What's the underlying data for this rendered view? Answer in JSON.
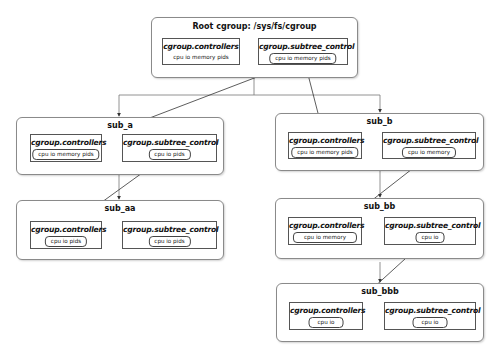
{
  "root": {
    "title": "Root cgroup: /sys/fs/cgroup",
    "controllers_label": "cgroup.controllers",
    "controllers_value": "cpu io memory pids",
    "subtree_label": "cgroup.subtree_control",
    "subtree_value": "cpu io memory pids"
  },
  "sub_a": {
    "title": "sub_a",
    "controllers_label": "cgroup.controllers",
    "controllers_value": "cpu io memory pids",
    "subtree_label": "cgroup.subtree_control",
    "subtree_value": "cpu io pids"
  },
  "sub_aa": {
    "title": "sub_aa",
    "controllers_label": "cgroup.controllers",
    "controllers_value": "cpu io pids",
    "subtree_label": "cgroup.subtree_control",
    "subtree_value": "cpu io pids"
  },
  "sub_b": {
    "title": "sub_b",
    "controllers_label": "cgroup.controllers",
    "controllers_value": "cpu io memory pids",
    "subtree_label": "cgroup.subtree_control",
    "subtree_value": "cpu io memory"
  },
  "sub_bb": {
    "title": "sub_bb",
    "controllers_label": "cgroup.controllers",
    "controllers_value": "cpu io memory",
    "subtree_label": "cgroup.subtree_control",
    "subtree_value": "cpu io"
  },
  "sub_bbb": {
    "title": "sub_bbb",
    "controllers_label": "cgroup.controllers",
    "controllers_value": "cpu io",
    "subtree_label": "cgroup.subtree_control",
    "subtree_value": "cpu io"
  }
}
